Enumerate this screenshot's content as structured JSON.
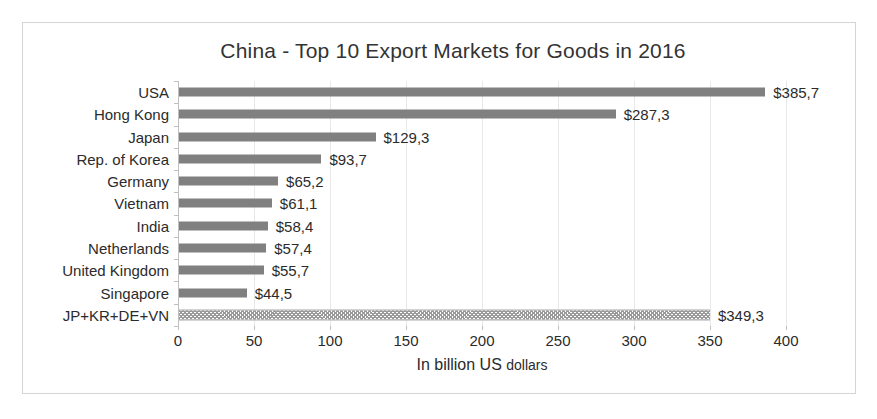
{
  "chart_data": {
    "type": "bar",
    "orientation": "horizontal",
    "title": "China - Top 10 Export Markets for Goods in 2016",
    "xlabel_main": "In billion US",
    "xlabel_small": "dollars",
    "xlabel": "In billion US dollars",
    "ylabel": "",
    "xlim": [
      0,
      400
    ],
    "xticks": [
      0,
      50,
      100,
      150,
      200,
      250,
      300,
      350,
      400
    ],
    "xtick_labels": [
      "0",
      "50",
      "100",
      "150",
      "200",
      "250",
      "300",
      "350",
      "400"
    ],
    "grid": true,
    "grid_axis": "x",
    "legend": false,
    "bar_color": "#808080",
    "highlight_bar_color": "#9a9a9a",
    "categories": [
      "USA",
      "Hong Kong",
      "Japan",
      "Rep. of Korea",
      "Germany",
      "Vietnam",
      "India",
      "Netherlands",
      "United Kingdom",
      "Singapore",
      "JP+KR+DE+VN"
    ],
    "values": [
      385.7,
      287.3,
      129.3,
      93.7,
      65.2,
      61.1,
      58.4,
      57.4,
      55.7,
      44.5,
      349.3
    ],
    "value_labels": [
      "$385,7",
      "$287,3",
      "$129,3",
      "$93,7",
      "$65,2",
      "$61,1",
      "$58,4",
      "$57,4",
      "$55,7",
      "$44,5",
      "$349,3"
    ],
    "patterned_indices": [
      10
    ]
  }
}
